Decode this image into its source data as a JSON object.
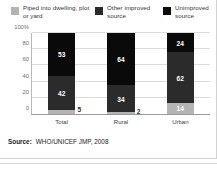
{
  "chart_data": {
    "type": "bar",
    "subtype": "stacked-100-percent",
    "title": "",
    "xlabel": "",
    "ylabel": "",
    "ylim": [
      0,
      100
    ],
    "yticks": [
      "0",
      "20",
      "40",
      "60",
      "80",
      "100%"
    ],
    "ytick_values": [
      0,
      20,
      40,
      60,
      80,
      100
    ],
    "grid": true,
    "legend_position": "top",
    "categories": [
      "Total",
      "Rural",
      "Urban"
    ],
    "series": [
      {
        "name": "Piped into dwelling, plot or yard",
        "color": "#b4b4b4",
        "values": [
          5,
          2,
          14
        ],
        "label_position": [
          "outside",
          "outside",
          "inside"
        ]
      },
      {
        "name": "Other improved source",
        "color": "#2b2b2b",
        "values": [
          42,
          34,
          62
        ],
        "label_position": [
          "inside",
          "inside",
          "inside"
        ]
      },
      {
        "name": "Unimproved source",
        "color": "#0a0a0a",
        "values": [
          53,
          64,
          24
        ],
        "label_position": [
          "inside",
          "inside",
          "inside"
        ]
      }
    ]
  },
  "legend": {
    "items": [
      {
        "label": "Piped into dwelling, plot or yard",
        "color": "#b4b4b4",
        "swatch_name": "legend-swatch-piped"
      },
      {
        "label": "Other improved source",
        "color": "#2b2b2b",
        "swatch_name": "legend-swatch-other-improved"
      },
      {
        "label": "Unimproved source",
        "color": "#0a0a0a",
        "swatch_name": "legend-swatch-unimproved"
      }
    ]
  },
  "source": {
    "key": "Source:",
    "value": "WHO/UNICEF JMP, 2008"
  }
}
